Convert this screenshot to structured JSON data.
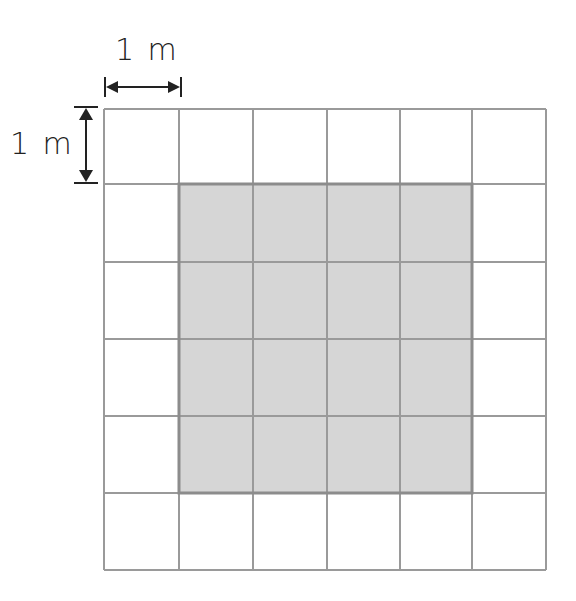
{
  "diagram": {
    "title": "",
    "grid": {
      "columns": 6,
      "rows": 6,
      "cell_unit": "1 m",
      "x_lines": [
        104,
        179,
        253,
        327,
        400,
        472,
        546
      ],
      "y_lines": [
        109,
        184,
        262,
        339,
        416,
        493,
        570
      ],
      "line_color": "#9a9a9a",
      "background": "#ffffff"
    },
    "shaded_region": {
      "col_start": 1,
      "col_end": 5,
      "row_start": 1,
      "row_end": 5,
      "size": "4 m x 4 m",
      "area_squares": 16,
      "fill": "#d6d6d6",
      "border": "#8c8c8c"
    },
    "horizontal_dimension": {
      "label": "1 m",
      "direction": "horizontal"
    },
    "vertical_dimension": {
      "label": "1 m",
      "direction": "vertical"
    }
  }
}
